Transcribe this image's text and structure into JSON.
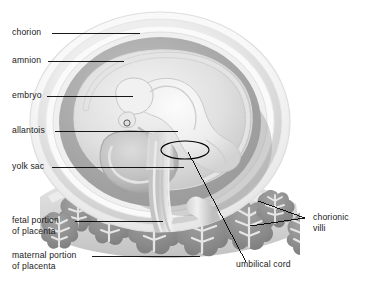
{
  "figure": {
    "type": "anatomical-diagram",
    "background_color": "#ffffff",
    "rule_color": "#1a1a1a"
  },
  "labels": {
    "chorion": "chorion",
    "amnion": "amnion",
    "embryo": "embryo",
    "allantois": "allantois",
    "yolk_sac": "yolk sac",
    "fetal_portion_line1": "fetal portion",
    "fetal_portion_line2": "of placenta",
    "maternal_portion_line1": "maternal portion",
    "maternal_portion_line2": "of placenta",
    "chorionic_villi_line1": "chorionic",
    "chorionic_villi_line2": "villi",
    "umbilical_cord": "umbilical cord"
  },
  "colors": {
    "outer_membrane": "#f2f2f2",
    "chorion_ring": "#d9d9d9",
    "amnion_cavity": "#a9a9a9",
    "inner_cavity": "#c9c9c9",
    "embryo_body": "#eaeaea",
    "yolk_sac": "#bdbdbd",
    "villi": "#8f8f8f",
    "villi_core": "#e2e2e2",
    "placenta_base": "#cfcfcf",
    "leader_line": "#000000"
  }
}
